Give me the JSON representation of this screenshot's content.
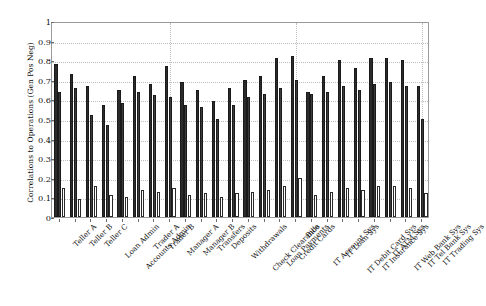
{
  "chart_data": {
    "type": "bar",
    "title": "",
    "xlabel": "",
    "ylabel": "Correlations to Operations (Gen Pos Neg)",
    "ylim": [
      0,
      1
    ],
    "yticks": [
      0,
      0.1,
      0.2,
      0.3,
      0.4,
      0.5,
      0.6,
      0.7,
      0.8,
      0.9,
      1
    ],
    "ytick_labels": [
      "0",
      "0.1",
      "0.2",
      "0.3",
      "0.4",
      "0.5",
      "0.6",
      "0.7",
      "0.8",
      "0.9",
      "1"
    ],
    "grid": true,
    "legend": null,
    "categories": [
      "Teller A",
      "Teller B",
      "Teller C",
      "Loan Admin",
      "Accounts Admin",
      "Trader A",
      "Trader B",
      "Manager A",
      "Manager B",
      "Transfers",
      "Deposits",
      "Withdrawals",
      "Check Clearance",
      "Loan Payments",
      "Credit Cards",
      "Bills",
      "IT Account Sys",
      "IT Loan Sys",
      "IT Debit Card Sys",
      "IT Insurance Sys",
      "IT ATM Sys",
      "IT Web Bank Sys",
      "IT Tel Bank Sys",
      "IT Trading Sys"
    ],
    "series": [
      {
        "name": "series-1",
        "color": "#2b2b2b",
        "values": [
          0.78,
          0.73,
          0.67,
          0.57,
          0.65,
          0.72,
          0.68,
          0.77,
          0.69,
          0.65,
          0.59,
          0.66,
          0.7,
          0.72,
          0.81,
          0.82,
          0.64,
          0.72,
          0.8,
          0.76,
          0.81,
          0.81,
          0.8,
          0.67
        ]
      },
      {
        "name": "series-2",
        "color": "#3c3c3c",
        "values": [
          0.64,
          0.66,
          0.52,
          0.47,
          0.58,
          0.64,
          0.62,
          0.61,
          0.57,
          0.56,
          0.5,
          0.57,
          0.61,
          0.63,
          0.66,
          0.7,
          0.63,
          0.64,
          0.67,
          0.65,
          0.68,
          0.69,
          0.67,
          0.5
        ]
      },
      {
        "name": "series-3",
        "color": "#ffffff",
        "values": [
          0.15,
          0.09,
          0.16,
          0.11,
          0.1,
          0.14,
          0.13,
          0.15,
          0.11,
          0.12,
          0.1,
          0.12,
          0.13,
          0.14,
          0.16,
          0.2,
          0.11,
          0.13,
          0.15,
          0.14,
          0.16,
          0.16,
          0.15,
          0.12
        ]
      }
    ]
  }
}
